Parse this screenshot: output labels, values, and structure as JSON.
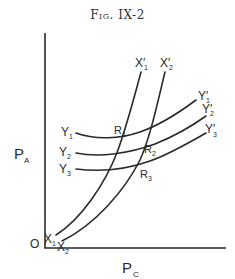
{
  "figure": {
    "title": "Fig. IX-2"
  },
  "axes": {
    "origin_label": "O",
    "y_label": "P",
    "y_label_sub": "A",
    "x_label": "P",
    "x_label_sub": "C"
  },
  "curves": {
    "Y1": {
      "start": "Y",
      "start_sub": "1",
      "end": "Y′",
      "end_sub": "1"
    },
    "Y2": {
      "start": "Y",
      "start_sub": "2",
      "end": "Y′",
      "end_sub": "2"
    },
    "Y3": {
      "start": "Y",
      "start_sub": "3",
      "end": "Y′",
      "end_sub": "3"
    },
    "X1": {
      "start": "X",
      "start_sub": "1",
      "end": "X′",
      "end_sub": "1"
    },
    "X2": {
      "start": "X",
      "start_sub": "2",
      "end": "X′",
      "end_sub": "2"
    }
  },
  "intersections": [
    {
      "label": "R",
      "sub": "1"
    },
    {
      "label": "R",
      "sub": "2"
    },
    {
      "label": "R",
      "sub": "3"
    }
  ],
  "colors": {
    "ink": "#2a2a2a",
    "background": "#ffffff"
  }
}
